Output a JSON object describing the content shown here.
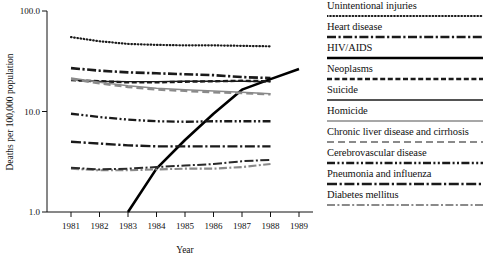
{
  "chart_data": {
    "type": "line",
    "title": "",
    "xlabel": "Year",
    "ylabel": "Deaths per 100,000 population",
    "yscale": "log",
    "ylim": [
      1.0,
      100.0
    ],
    "ytick_labels": [
      "100.0",
      "10.0",
      "1.0"
    ],
    "ytick_values": [
      100.0,
      10.0,
      1.0
    ],
    "x": [
      1981,
      1982,
      1983,
      1984,
      1985,
      1986,
      1987,
      1988,
      1989
    ],
    "xtick_labels": [
      "1981",
      "1982",
      "1983",
      "1984",
      "1985",
      "1986",
      "1987",
      "1988",
      "1989"
    ],
    "grid": false,
    "legend_position": "right",
    "series": [
      {
        "name": "Unintentional injuries",
        "style": "dotted",
        "color": "#1a1a1a",
        "x": [
          1981,
          1982,
          1983,
          1984,
          1985,
          1986,
          1987,
          1988
        ],
        "values": [
          55.0,
          50.0,
          47.0,
          46.0,
          45.5,
          45.5,
          45.0,
          44.5
        ]
      },
      {
        "name": "Heart disease",
        "style": "dash-dot",
        "color": "#1a1a1a",
        "x": [
          1981,
          1982,
          1983,
          1984,
          1985,
          1986,
          1987,
          1988
        ],
        "values": [
          27.0,
          25.5,
          24.5,
          24.0,
          23.5,
          23.0,
          22.0,
          21.5
        ]
      },
      {
        "name": "HIV/AIDS",
        "style": "solid",
        "color": "#000000",
        "x": [
          1983,
          1984,
          1985,
          1986,
          1987,
          1988,
          1989
        ],
        "values": [
          1.0,
          2.7,
          5.2,
          9.5,
          16.5,
          21.0,
          26.5
        ]
      },
      {
        "name": "Neoplasms",
        "style": "dashed",
        "color": "#1a1a1a",
        "x": [
          1981,
          1982,
          1983,
          1984,
          1985,
          1986,
          1987,
          1988
        ],
        "values": [
          20.5,
          20.0,
          19.5,
          19.5,
          19.8,
          20.0,
          20.2,
          20.0
        ]
      },
      {
        "name": "Suicide",
        "style": "solid-thin",
        "color": "#1a1a1a",
        "x": [
          1981,
          1982,
          1983,
          1984,
          1985,
          1986,
          1987,
          1988
        ],
        "values": [
          20.5,
          20.0,
          19.8,
          19.8,
          20.0,
          20.0,
          20.0,
          19.8
        ]
      },
      {
        "name": "Homicide",
        "style": "solid-gray",
        "color": "#8a8a8a",
        "x": [
          1981,
          1982,
          1983,
          1984,
          1985,
          1986,
          1987,
          1988
        ],
        "values": [
          21.5,
          19.5,
          18.0,
          17.0,
          16.5,
          16.0,
          15.5,
          15.0
        ]
      },
      {
        "name": "Chronic liver disease and cirrhosis",
        "style": "long-dash-gray",
        "color": "#8a8a8a",
        "x": [
          1981,
          1982,
          1983,
          1984,
          1985,
          1986,
          1987,
          1988
        ],
        "values": [
          21.0,
          19.0,
          17.5,
          16.5,
          16.0,
          15.5,
          15.2,
          14.8
        ]
      },
      {
        "name": "Cerebrovascular disease",
        "style": "dash-dot-dot",
        "color": "#1a1a1a",
        "x": [
          1981,
          1982,
          1983,
          1984,
          1985,
          1986,
          1987,
          1988
        ],
        "values": [
          9.5,
          8.8,
          8.3,
          8.0,
          7.9,
          8.0,
          8.0,
          8.0
        ]
      },
      {
        "name": "Pneumonia and influenza",
        "style": "dash-dot-long",
        "color": "#1a1a1a",
        "x": [
          1981,
          1982,
          1983,
          1984,
          1985,
          1986,
          1987,
          1988
        ],
        "values": [
          5.0,
          4.8,
          4.6,
          4.5,
          4.5,
          4.5,
          4.5,
          4.5
        ]
      },
      {
        "name": "Diabetes mellitus",
        "style": "dash-dot-gray",
        "color": "#8a8a8a",
        "x": [
          1981,
          1982,
          1983,
          1984,
          1985,
          1986,
          1987,
          1988
        ],
        "values": [
          2.7,
          2.6,
          2.6,
          2.65,
          2.7,
          2.7,
          2.8,
          3.0
        ]
      },
      {
        "name": "Pneumonia trend upper",
        "style": "dash-dot-dark",
        "color": "#2a2a2a",
        "x": [
          1981,
          1982,
          1983,
          1984,
          1985,
          1986,
          1987,
          1988
        ],
        "values": [
          2.75,
          2.65,
          2.7,
          2.8,
          2.9,
          3.0,
          3.2,
          3.3
        ]
      }
    ],
    "legend_entries": [
      {
        "label": "Unintentional injuries",
        "style": "dotted",
        "color": "#1a1a1a"
      },
      {
        "label": "Heart disease",
        "style": "dash-dot",
        "color": "#1a1a1a"
      },
      {
        "label": "HIV/AIDS",
        "style": "solid",
        "color": "#000000"
      },
      {
        "label": "Neoplasms",
        "style": "dashed",
        "color": "#1a1a1a"
      },
      {
        "label": "Suicide",
        "style": "solid-thin",
        "color": "#1a1a1a"
      },
      {
        "label": "Homicide",
        "style": "solid-gray",
        "color": "#8a8a8a"
      },
      {
        "label": "Chronic liver disease and cirrhosis",
        "style": "long-dash-gray",
        "color": "#8a8a8a"
      },
      {
        "label": "Cerebrovascular disease",
        "style": "dash-dot-dot",
        "color": "#1a1a1a"
      },
      {
        "label": "Pneumonia and influenza",
        "style": "dash-dot-long",
        "color": "#1a1a1a"
      },
      {
        "label": "Diabetes mellitus",
        "style": "dash-dot-gray",
        "color": "#8a8a8a"
      }
    ]
  }
}
